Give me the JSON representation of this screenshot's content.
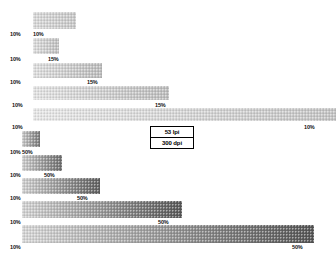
{
  "chart_data": {
    "type": "bar",
    "title": "",
    "subtitle": "",
    "xlabel": "",
    "ylabel": "",
    "orientation": "horizontal",
    "grid": false,
    "legend": null,
    "axis_visible": false,
    "categories": [
      "band-1",
      "band-2",
      "band-3",
      "band-4",
      "band-5",
      "band-6",
      "band-7",
      "band-8",
      "band-9",
      "band-10"
    ],
    "bars": [
      {
        "name": "band-1",
        "x": 33,
        "y": 12,
        "width": 43,
        "height": 17,
        "start_tint": "10%",
        "end_tint": "10%",
        "start_color": "#d8d8d8",
        "end_color": "#c8c8c8",
        "left_label": "10%",
        "left_label_x": 10,
        "left_label_y": 31,
        "right_label": "10%",
        "right_label_x": 33,
        "right_label_y": 31
      },
      {
        "name": "band-2",
        "x": 33,
        "y": 38,
        "width": 26,
        "height": 16,
        "start_tint": "10%",
        "end_tint": "15%",
        "start_color": "#dcdcdc",
        "end_color": "#c0c0c0",
        "left_label": "10%",
        "left_label_x": 10,
        "left_label_y": 56,
        "right_label": "15%",
        "right_label_x": 48,
        "right_label_y": 56
      },
      {
        "name": "band-3",
        "x": 33,
        "y": 63,
        "width": 69,
        "height": 15,
        "start_tint": "10%",
        "end_tint": "15%",
        "start_color": "#dedede",
        "end_color": "#bcbcbc",
        "left_label": "10%",
        "left_label_x": 10,
        "left_label_y": 79,
        "right_label": "15%",
        "right_label_x": 87,
        "right_label_y": 79
      },
      {
        "name": "band-4",
        "x": 33,
        "y": 86,
        "width": 136,
        "height": 14,
        "start_tint": "10%",
        "end_tint": "15%",
        "start_color": "#e2e2e2",
        "end_color": "#bdbdbd",
        "left_label": "10%",
        "left_label_x": 12,
        "left_label_y": 102,
        "right_label": "15%",
        "right_label_x": 155,
        "right_label_y": 102
      },
      {
        "name": "band-5",
        "x": 33,
        "y": 108,
        "width": 303,
        "height": 13,
        "start_tint": "10%",
        "end_tint": "10%",
        "start_color": "#e6e6e6",
        "end_color": "#c4c4c4",
        "left_label": "10%",
        "left_label_x": 12,
        "left_label_y": 124,
        "right_label": "10%",
        "right_label_x": 304,
        "right_label_y": 124
      },
      {
        "name": "band-6",
        "x": 22,
        "y": 131,
        "width": 18,
        "height": 16,
        "start_tint": "10%",
        "end_tint": "50%",
        "start_color": "#c8c8c8",
        "end_color": "#7a7a7a",
        "left_label": "10%",
        "left_label_x": 10,
        "left_label_y": 149,
        "right_label": "50%",
        "right_label_x": 22,
        "right_label_y": 149
      },
      {
        "name": "band-7",
        "x": 22,
        "y": 155,
        "width": 40,
        "height": 16,
        "start_tint": "10%",
        "end_tint": "50%",
        "start_color": "#cccccc",
        "end_color": "#6e6e6e",
        "left_label": "10%",
        "left_label_x": 10,
        "left_label_y": 172,
        "right_label": "50%",
        "right_label_x": 44,
        "right_label_y": 172
      },
      {
        "name": "band-8",
        "x": 22,
        "y": 178,
        "width": 78,
        "height": 16,
        "start_tint": "10%",
        "end_tint": "50%",
        "start_color": "#cfcfcf",
        "end_color": "#606060",
        "left_label": "10%",
        "left_label_x": 10,
        "left_label_y": 195,
        "right_label": "50%",
        "right_label_x": 77,
        "right_label_y": 195
      },
      {
        "name": "band-9",
        "x": 22,
        "y": 201,
        "width": 160,
        "height": 17,
        "start_tint": "10%",
        "end_tint": "50%",
        "start_color": "#d2d2d2",
        "end_color": "#585858",
        "left_label": "10%",
        "left_label_x": 10,
        "left_label_y": 219,
        "right_label": "50%",
        "right_label_x": 158,
        "right_label_y": 219
      },
      {
        "name": "band-10",
        "x": 22,
        "y": 225,
        "width": 292,
        "height": 18,
        "start_tint": "10%",
        "end_tint": "50%",
        "start_color": "#d5d5d5",
        "end_color": "#555555",
        "left_label": "10%",
        "left_label_x": 10,
        "left_label_y": 244,
        "right_label": "50%",
        "right_label_x": 292,
        "right_label_y": 244
      }
    ],
    "annotations": [
      {
        "text": "53 lpi",
        "x": 155,
        "y": 128
      },
      {
        "text": "300 dpi",
        "x": 155,
        "y": 141
      }
    ]
  },
  "spec_box": {
    "x": 150,
    "y": 126,
    "width": 44,
    "height": 29,
    "screen_ruling": "53 lpi",
    "output_resolution": "300 dpi"
  }
}
